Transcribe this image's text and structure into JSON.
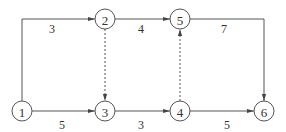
{
  "diagram": {
    "type": "activity-network",
    "nodes": [
      {
        "id": "1",
        "label": "1"
      },
      {
        "id": "2",
        "label": "2"
      },
      {
        "id": "3",
        "label": "3"
      },
      {
        "id": "4",
        "label": "4"
      },
      {
        "id": "5",
        "label": "5"
      },
      {
        "id": "6",
        "label": "6"
      }
    ],
    "edges": [
      {
        "from": "1",
        "to": "2",
        "weight": "3",
        "style": "solid"
      },
      {
        "from": "1",
        "to": "3",
        "weight": "5",
        "style": "solid"
      },
      {
        "from": "2",
        "to": "5",
        "weight": "4",
        "style": "solid"
      },
      {
        "from": "2",
        "to": "3",
        "weight": "",
        "style": "dashed"
      },
      {
        "from": "3",
        "to": "4",
        "weight": "3",
        "style": "solid"
      },
      {
        "from": "4",
        "to": "5",
        "weight": "",
        "style": "dashed"
      },
      {
        "from": "4",
        "to": "6",
        "weight": "5",
        "style": "solid"
      },
      {
        "from": "5",
        "to": "6",
        "weight": "7",
        "style": "solid"
      }
    ]
  }
}
